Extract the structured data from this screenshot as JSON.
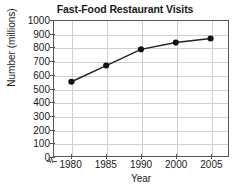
{
  "chart_data": {
    "type": "line",
    "title": "Fast-Food Restaurant Visits",
    "xlabel": "Year",
    "ylabel": "Number (millions)",
    "categories": [
      "1980",
      "1985",
      "1990",
      "2000",
      "2005"
    ],
    "values": [
      550,
      670,
      790,
      840,
      870
    ],
    "ylim": [
      0,
      1000
    ],
    "y_ticks": [
      0,
      100,
      200,
      300,
      400,
      500,
      600,
      700,
      800,
      900,
      1000
    ],
    "y_tick_labels": [
      "0",
      "100",
      "200",
      "300",
      "400",
      "500",
      "600",
      "700",
      "800",
      "900",
      "1000"
    ],
    "x_tick_labels": [
      "1980",
      "1985",
      "1990",
      "2000",
      "2005"
    ],
    "grid": true,
    "grid_color": "#cfcfcf",
    "legend": null,
    "legend_position": "none",
    "series": [
      {
        "name": "Fast-Food Restaurant Visits",
        "values": [
          550,
          670,
          790,
          840,
          870
        ],
        "line_color": "#222222",
        "marker": "circle",
        "marker_color": "#111111"
      }
    ],
    "annotations": [
      {
        "name": "x-axis-break",
        "description": "axis break symbol near origin on the horizontal axis"
      }
    ],
    "axis_color": "#555555",
    "note": "Year axis categories are evenly spaced although 1990 to 2000 spans ten years"
  }
}
